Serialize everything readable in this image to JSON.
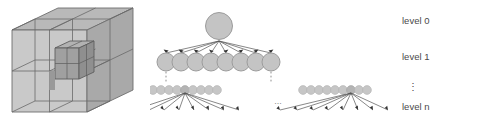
{
  "figure": {
    "type": "octree-diagram",
    "left_panel": {
      "name": "octree-cube-illustration",
      "description": "cube subdivided into octants with nested inner cube",
      "colors": {
        "top_face": "#b8b8b8",
        "left_face": "#c9c9c9",
        "right_face": "#a8a8a8",
        "inner_cube_top": "#b0b0b0",
        "inner_cube_left": "#9a9a9a",
        "inner_cube_right": "#8c8c8c",
        "edge": "#6e6e6e"
      }
    },
    "right_panel": {
      "name": "octree-tree",
      "node_fill": "#c4c4c4",
      "node_stroke": "#9a9a9a",
      "edge_color": "#555555",
      "levels": [
        {
          "id": "level-0",
          "label": "level 0",
          "node_count": 1,
          "node_radius": 13
        },
        {
          "id": "level-1",
          "label": "level 1",
          "node_count": 8,
          "node_radius": 9
        },
        {
          "id": "level-mid",
          "label": "⋮",
          "node_count": 0,
          "node_radius": 0
        },
        {
          "id": "level-n",
          "label": "level n",
          "node_count": 8,
          "node_radius": 2
        }
      ],
      "small_row_node_count": 9,
      "small_row_clusters": 2,
      "cluster_gap_ellipsis": "...",
      "vertical_ellipsis": "⋮"
    }
  }
}
